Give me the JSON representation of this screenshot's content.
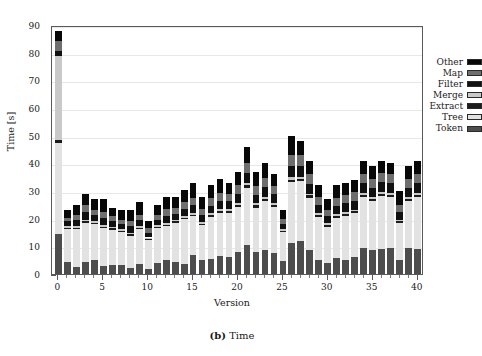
{
  "caption": {
    "label": "(b)",
    "text": "Time"
  },
  "chart_data": {
    "type": "bar",
    "stacked": true,
    "title": "",
    "subtitle": "",
    "xlabel": "Version",
    "ylabel": "Time [s]",
    "xlim": [
      -0.7,
      40.7
    ],
    "ylim": [
      0,
      90
    ],
    "xticks": [
      0,
      5,
      10,
      15,
      20,
      25,
      30,
      35,
      40
    ],
    "xtick_labels": [
      "0",
      "5",
      "10",
      "15",
      "20",
      "25",
      "30",
      "35",
      "40"
    ],
    "xtick_minor_step": 1,
    "yticks": [
      0,
      10,
      20,
      30,
      40,
      50,
      60,
      70,
      80,
      90
    ],
    "ytick_labels": [
      "0",
      "10",
      "20",
      "30",
      "40",
      "50",
      "60",
      "70",
      "80",
      "90"
    ],
    "grid": true,
    "grid_axis": "y",
    "legend_position": "top-right",
    "categories": [
      0,
      1,
      2,
      3,
      4,
      5,
      6,
      7,
      8,
      9,
      10,
      11,
      12,
      13,
      14,
      15,
      16,
      17,
      18,
      19,
      20,
      21,
      22,
      23,
      24,
      25,
      26,
      27,
      28,
      29,
      30,
      31,
      32,
      33,
      34,
      35,
      36,
      37,
      38,
      39,
      40
    ],
    "series": [
      {
        "name": "Token",
        "color": "#4d4d4d",
        "values": [
          14.5,
          4.2,
          2.6,
          4.4,
          5.0,
          3.0,
          3.4,
          3.1,
          2.3,
          3.6,
          1.7,
          4.0,
          5.2,
          4.4,
          3.8,
          6.8,
          5.1,
          5.6,
          6.6,
          6.2,
          7.8,
          10.6,
          8.0,
          8.8,
          7.6,
          4.6,
          11.2,
          12.0,
          8.6,
          5.2,
          4.1,
          5.8,
          5.0,
          6.0,
          9.3,
          8.8,
          9.1,
          9.3,
          5.0,
          9.3,
          9.2
        ]
      },
      {
        "name": "Tree",
        "color": "#e2e2e2",
        "values": [
          33.0,
          12.0,
          13.5,
          14.0,
          13.0,
          13.5,
          12.5,
          12.0,
          11.5,
          12.5,
          10.5,
          12.5,
          12.0,
          14.0,
          16.0,
          14.0,
          12.5,
          15.0,
          15.5,
          16.0,
          16.5,
          20.5,
          16.0,
          17.5,
          16.5,
          10.5,
          22.0,
          21.5,
          19.0,
          15.5,
          13.0,
          14.5,
          16.0,
          16.0,
          18.5,
          17.5,
          19.0,
          18.5,
          13.5,
          17.0,
          18.5
        ]
      },
      {
        "name": "Extract",
        "color": "#1c1c1c",
        "values": [
          0.9,
          0.6,
          0.6,
          0.6,
          0.6,
          0.6,
          0.6,
          0.6,
          0.6,
          0.6,
          0.5,
          0.6,
          0.6,
          0.6,
          0.6,
          0.7,
          0.6,
          0.7,
          0.7,
          0.7,
          0.8,
          0.9,
          0.8,
          0.8,
          0.8,
          0.6,
          0.9,
          0.9,
          0.8,
          0.7,
          0.6,
          0.7,
          0.7,
          0.7,
          0.8,
          0.8,
          0.8,
          0.8,
          0.6,
          0.8,
          0.8
        ]
      },
      {
        "name": "Merge",
        "color": "#c9c9c9",
        "values": [
          30.5,
          0.6,
          0.6,
          0.6,
          0.6,
          0.6,
          0.6,
          0.6,
          0.6,
          0.6,
          0.5,
          0.6,
          0.6,
          0.6,
          0.6,
          0.6,
          0.6,
          0.6,
          0.7,
          0.7,
          0.7,
          0.8,
          0.7,
          0.7,
          0.7,
          0.5,
          0.8,
          0.8,
          0.7,
          0.6,
          0.6,
          0.6,
          0.6,
          0.6,
          0.7,
          0.7,
          0.7,
          0.7,
          0.6,
          0.7,
          0.7
        ]
      },
      {
        "name": "Filter",
        "color": "#111111",
        "values": [
          1.8,
          1.6,
          2.2,
          2.8,
          2.0,
          2.4,
          2.0,
          1.8,
          2.3,
          2.2,
          1.8,
          2.0,
          2.6,
          2.2,
          2.6,
          2.8,
          2.6,
          2.8,
          3.0,
          2.8,
          3.2,
          3.8,
          3.2,
          3.6,
          3.2,
          2.0,
          4.2,
          4.0,
          3.6,
          3.0,
          2.6,
          3.0,
          3.2,
          3.2,
          3.6,
          3.4,
          3.6,
          3.5,
          2.8,
          3.4,
          3.6
        ]
      },
      {
        "name": "Map",
        "color": "#6e6e6e",
        "values": [
          3.4,
          1.4,
          2.0,
          2.5,
          2.0,
          2.2,
          1.8,
          1.6,
          2.0,
          2.0,
          1.5,
          1.8,
          2.4,
          2.2,
          2.4,
          2.6,
          2.2,
          2.6,
          2.8,
          2.6,
          3.0,
          3.6,
          3.0,
          3.2,
          3.0,
          1.8,
          4.0,
          3.8,
          3.4,
          2.8,
          2.4,
          2.8,
          3.0,
          3.0,
          3.4,
          3.2,
          3.4,
          3.2,
          2.6,
          3.2,
          3.4
        ]
      },
      {
        "name": "Other",
        "color": "#080808",
        "values": [
          3.9,
          2.6,
          3.5,
          4.1,
          3.8,
          4.7,
          3.1,
          3.3,
          3.7,
          4.5,
          2.5,
          3.5,
          4.6,
          4.0,
          4.4,
          5.5,
          4.4,
          4.7,
          5.2,
          4.0,
          5.0,
          5.8,
          5.3,
          5.4,
          4.2,
          3.0,
          6.9,
          5.0,
          4.9,
          4.2,
          3.7,
          4.6,
          4.5,
          4.5,
          4.7,
          4.6,
          4.4,
          4.0,
          4.9,
          4.6,
          4.8
        ]
      }
    ],
    "legend_entries": [
      {
        "label": "Other",
        "color": "#080808"
      },
      {
        "label": "Map",
        "color": "#6e6e6e"
      },
      {
        "label": "Filter",
        "color": "#111111"
      },
      {
        "label": "Merge",
        "color": "#c9c9c9"
      },
      {
        "label": "Extract",
        "color": "#1c1c1c"
      },
      {
        "label": "Tree",
        "color": "#e2e2e2"
      },
      {
        "label": "Token",
        "color": "#4d4d4d"
      }
    ]
  }
}
